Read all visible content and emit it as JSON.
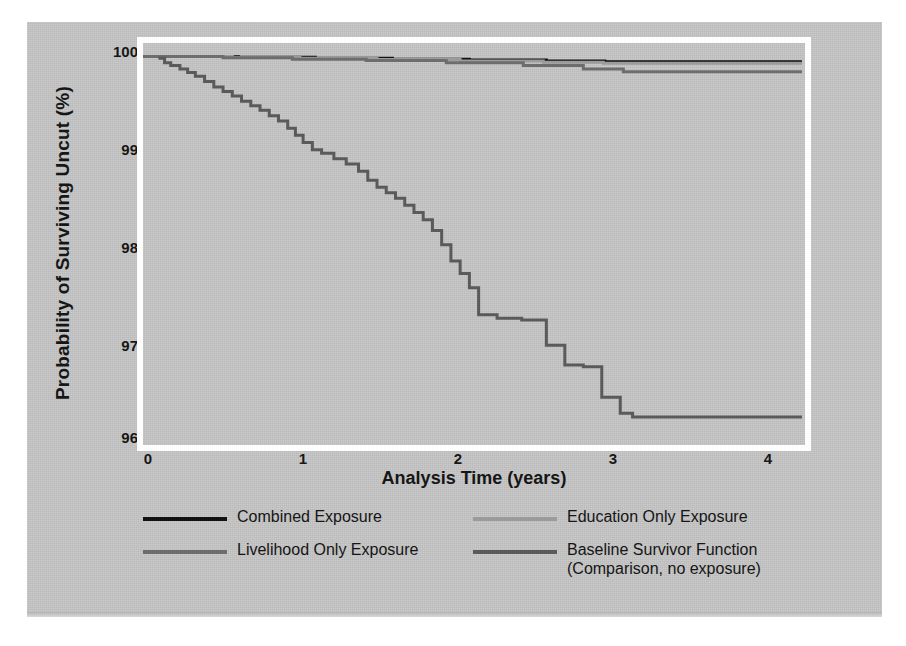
{
  "figure": {
    "background_color": "#c6c6c6",
    "frame_color": "#fdfdfd"
  },
  "chart_data": {
    "type": "line",
    "subtype": "kaplan-meier-survival-step",
    "title": "",
    "xlabel": "Analysis Time (years)",
    "ylabel": "Probability of Surviving Uncut (%)",
    "xlim": [
      0,
      4.3
    ],
    "ylim": [
      95.6,
      100.15
    ],
    "xticks": [
      "0",
      "1",
      "2",
      "3",
      "4"
    ],
    "xtick_values": [
      0,
      1,
      2,
      3,
      4
    ],
    "yticks": [
      "100",
      "99",
      "98",
      "97",
      "96"
    ],
    "ytick_values": [
      100,
      99,
      98,
      97,
      96
    ],
    "grid": false,
    "legend_position": "below-axes",
    "series": [
      {
        "name": "Combined Exposure",
        "color": "#111111",
        "points": [
          [
            0.0,
            100.0
          ],
          [
            0.55,
            100.0
          ],
          [
            0.62,
            99.99
          ],
          [
            1.05,
            99.99
          ],
          [
            1.12,
            99.98
          ],
          [
            1.55,
            99.98
          ],
          [
            1.62,
            99.97
          ],
          [
            2.05,
            99.97
          ],
          [
            2.12,
            99.96
          ],
          [
            2.55,
            99.96
          ],
          [
            2.62,
            99.95
          ],
          [
            2.95,
            99.95
          ],
          [
            3.0,
            99.94
          ],
          [
            4.28,
            99.94
          ]
        ]
      },
      {
        "name": "Education Only Exposure",
        "color": "#9b9b9b",
        "points": [
          [
            0.0,
            100.0
          ],
          [
            0.5,
            100.0
          ],
          [
            0.58,
            99.99
          ],
          [
            0.95,
            99.99
          ],
          [
            1.02,
            99.98
          ],
          [
            1.45,
            99.98
          ],
          [
            1.52,
            99.965
          ],
          [
            2.0,
            99.965
          ],
          [
            2.06,
            99.95
          ],
          [
            2.52,
            99.95
          ],
          [
            2.6,
            99.935
          ],
          [
            2.92,
            99.935
          ],
          [
            2.99,
            99.925
          ],
          [
            4.28,
            99.925
          ]
        ]
      },
      {
        "name": "Livelihood Only Exposure",
        "color": "#6d6d6d",
        "points": [
          [
            0.0,
            100.0
          ],
          [
            0.45,
            100.0
          ],
          [
            0.52,
            99.985
          ],
          [
            0.9,
            99.985
          ],
          [
            0.97,
            99.97
          ],
          [
            1.38,
            99.97
          ],
          [
            1.45,
            99.955
          ],
          [
            1.9,
            99.955
          ],
          [
            1.97,
            99.93
          ],
          [
            2.4,
            99.93
          ],
          [
            2.47,
            99.9
          ],
          [
            2.78,
            99.9
          ],
          [
            2.86,
            99.86
          ],
          [
            3.05,
            99.86
          ],
          [
            3.12,
            99.83
          ],
          [
            4.28,
            99.83
          ]
        ]
      },
      {
        "name": "Baseline Survivor Function",
        "sublabel": "(Comparison, no exposure)",
        "color": "#5a5a5a",
        "points": [
          [
            0.1,
            99.98
          ],
          [
            0.14,
            99.93
          ],
          [
            0.18,
            99.9
          ],
          [
            0.24,
            99.86
          ],
          [
            0.29,
            99.82
          ],
          [
            0.34,
            99.78
          ],
          [
            0.4,
            99.72
          ],
          [
            0.46,
            99.66
          ],
          [
            0.52,
            99.61
          ],
          [
            0.58,
            99.56
          ],
          [
            0.64,
            99.5
          ],
          [
            0.7,
            99.45
          ],
          [
            0.76,
            99.4
          ],
          [
            0.82,
            99.34
          ],
          [
            0.88,
            99.28
          ],
          [
            0.94,
            99.2
          ],
          [
            0.99,
            99.12
          ],
          [
            1.04,
            99.04
          ],
          [
            1.1,
            98.96
          ],
          [
            1.16,
            98.92
          ],
          [
            1.24,
            98.86
          ],
          [
            1.32,
            98.8
          ],
          [
            1.4,
            98.72
          ],
          [
            1.46,
            98.62
          ],
          [
            1.52,
            98.54
          ],
          [
            1.58,
            98.48
          ],
          [
            1.64,
            98.42
          ],
          [
            1.7,
            98.34
          ],
          [
            1.76,
            98.26
          ],
          [
            1.82,
            98.18
          ],
          [
            1.88,
            98.06
          ],
          [
            1.94,
            97.9
          ],
          [
            2.0,
            97.72
          ],
          [
            2.06,
            97.58
          ],
          [
            2.12,
            97.42
          ],
          [
            2.18,
            97.12
          ],
          [
            2.3,
            97.08
          ],
          [
            2.46,
            97.06
          ],
          [
            2.62,
            96.78
          ],
          [
            2.74,
            96.56
          ],
          [
            2.86,
            96.54
          ],
          [
            2.98,
            96.2
          ],
          [
            3.1,
            96.02
          ],
          [
            3.18,
            95.98
          ],
          [
            4.28,
            95.98
          ]
        ]
      }
    ]
  },
  "legend": {
    "entries": [
      {
        "label": "Combined Exposure",
        "color": "#111111",
        "sublabel": ""
      },
      {
        "label": "Education Only Exposure",
        "color": "#9b9b9b",
        "sublabel": ""
      },
      {
        "label": "Livelihood Only Exposure",
        "color": "#6d6d6d",
        "sublabel": ""
      },
      {
        "label": "Baseline Survivor Function",
        "color": "#5a5a5a",
        "sublabel": "(Comparison, no exposure)"
      }
    ]
  }
}
